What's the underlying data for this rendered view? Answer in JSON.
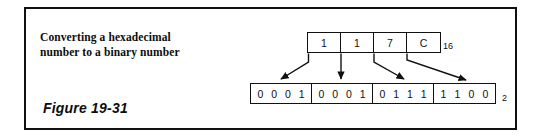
{
  "figure": {
    "caption_line1": "Converting a hexadecimal",
    "caption_line2": "number to a binary number",
    "label": "Figure 19-31"
  },
  "conversion": {
    "hex": {
      "digits": [
        "1",
        "1",
        "7",
        "C"
      ],
      "subscript": "16"
    },
    "binary": {
      "groups": [
        {
          "bits": [
            "0",
            "0",
            "0",
            "1"
          ]
        },
        {
          "bits": [
            "0",
            "0",
            "0",
            "1"
          ]
        },
        {
          "bits": [
            "0",
            "1",
            "1",
            "1"
          ]
        },
        {
          "bits": [
            "1",
            "1",
            "0",
            "0"
          ]
        }
      ],
      "subscript": "2"
    },
    "mappings": [
      {
        "from": "1",
        "to": "0001"
      },
      {
        "from": "1",
        "to": "0001"
      },
      {
        "from": "7",
        "to": "0111"
      },
      {
        "from": "C",
        "to": "1100"
      }
    ]
  },
  "colors": {
    "ink": "#111111",
    "paper": "#ffffff"
  }
}
